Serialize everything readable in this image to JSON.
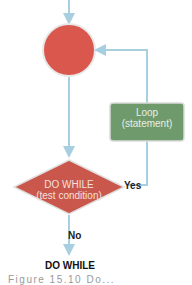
{
  "diagram": {
    "loop_box": {
      "line1": "Loop",
      "line2": "(statement)",
      "color": "#6f9a6c"
    },
    "decision": {
      "line1": "DO WHILE",
      "line2": "(test condition)",
      "color": "#c9574c"
    },
    "start_circle": {
      "color": "#d9574d"
    },
    "arrow_color": "#a8cfe0",
    "yes_label": "Yes",
    "no_label": "No",
    "title": "DO WHILE",
    "caption": "Figure 15.10 Do..."
  }
}
